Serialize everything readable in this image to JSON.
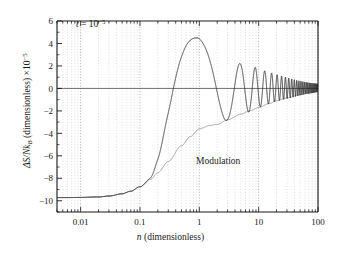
{
  "chart_data": {
    "type": "line",
    "title": "",
    "xlabel": "n (dimensionless)",
    "ylabel": "ΔS/Nk_B (dimensionless) ×10⁻⁵",
    "xscale": "log",
    "yscale": "linear",
    "xlim": [
      0.004,
      100
    ],
    "ylim": [
      -11,
      6
    ],
    "grid": "vertical dotted minor+major log gridlines",
    "legend": "none",
    "annotations": [
      {
        "name": "t-value",
        "text": "t = 10⁻⁵",
        "x": 0.022,
        "y": 5.0
      },
      {
        "name": "modulation-label",
        "text": "Modulation",
        "x": 3.0,
        "y": -6.0
      }
    ],
    "xticks": [
      {
        "value": 0.01,
        "label": "0.01"
      },
      {
        "value": 0.1,
        "label": "0.1"
      },
      {
        "value": 1,
        "label": "1"
      },
      {
        "value": 10,
        "label": "10"
      },
      {
        "value": 100,
        "label": "100"
      }
    ],
    "yticks": [
      {
        "value": 6,
        "label": "6"
      },
      {
        "value": 4,
        "label": "4"
      },
      {
        "value": 2,
        "label": "2"
      },
      {
        "value": 0,
        "label": "0"
      },
      {
        "value": -2,
        "label": "−2"
      },
      {
        "value": -4,
        "label": "−4"
      },
      {
        "value": -6,
        "label": "−6"
      },
      {
        "value": -8,
        "label": "−8"
      },
      {
        "value": -10,
        "label": "−10"
      }
    ],
    "series": [
      {
        "name": "Modulation",
        "style": "thin gray envelope curve",
        "color": "#8a8a8a",
        "description": "Lower envelope rising from plateau -9.7 toward 0",
        "points": [
          {
            "x": 0.004,
            "y": -9.72
          },
          {
            "x": 0.006,
            "y": -9.72
          },
          {
            "x": 0.01,
            "y": -9.7
          },
          {
            "x": 0.02,
            "y": -9.66
          },
          {
            "x": 0.03,
            "y": -9.58
          },
          {
            "x": 0.05,
            "y": -9.38
          },
          {
            "x": 0.07,
            "y": -9.15
          },
          {
            "x": 0.1,
            "y": -8.75
          },
          {
            "x": 0.15,
            "y": -8.1
          },
          {
            "x": 0.2,
            "y": -7.5
          },
          {
            "x": 0.3,
            "y": -6.5
          },
          {
            "x": 0.5,
            "y": -5.1
          },
          {
            "x": 0.7,
            "y": -4.3
          },
          {
            "x": 1.0,
            "y": -3.6
          },
          {
            "x": 1.5,
            "y": -3.3
          },
          {
            "x": 2.0,
            "y": -3.2
          },
          {
            "x": 3.0,
            "y": -2.8
          },
          {
            "x": 5.0,
            "y": -2.3
          },
          {
            "x": 7.0,
            "y": -2.0
          },
          {
            "x": 10,
            "y": -1.7
          },
          {
            "x": 15,
            "y": -1.35
          },
          {
            "x": 20,
            "y": -1.1
          },
          {
            "x": 30,
            "y": -0.85
          },
          {
            "x": 50,
            "y": -0.55
          },
          {
            "x": 70,
            "y": -0.42
          },
          {
            "x": 100,
            "y": -0.3
          }
        ]
      },
      {
        "name": "Entropy change",
        "style": "dark oscillating curve bounded by modulation envelope",
        "color": "#262626",
        "description": "Starts at plateau -9.7, rises, oscillates with decaying amplitude about zero; peak amplitudes 4.5, 2.8, 2.2, 2.0, 1.9 decreasing toward 0.4 at n=100",
        "peaks": [
          {
            "x": 0.95,
            "y": 4.5
          },
          {
            "x": 2.9,
            "y": 2.8
          },
          {
            "x": 4.9,
            "y": 2.2
          },
          {
            "x": 6.6,
            "y": 2.0
          },
          {
            "x": 8.4,
            "y": 1.9
          },
          {
            "x": 12,
            "y": 1.6
          },
          {
            "x": 18,
            "y": 1.3
          },
          {
            "x": 28,
            "y": 1.0
          },
          {
            "x": 45,
            "y": 0.7
          },
          {
            "x": 70,
            "y": 0.5
          },
          {
            "x": 100,
            "y": 0.4
          }
        ],
        "troughs": [
          {
            "x": 1.95,
            "y": -3.25
          },
          {
            "x": 3.9,
            "y": -2.55
          },
          {
            "x": 5.8,
            "y": -2.2
          },
          {
            "x": 7.5,
            "y": -2.05
          },
          {
            "x": 10,
            "y": -1.7
          },
          {
            "x": 15,
            "y": -1.35
          },
          {
            "x": 25,
            "y": -1.0
          },
          {
            "x": 40,
            "y": -0.75
          },
          {
            "x": 60,
            "y": -0.5
          },
          {
            "x": 85,
            "y": -0.38
          },
          {
            "x": 100,
            "y": -0.3
          }
        ],
        "plateau_value": -9.72
      }
    ]
  },
  "axes": {
    "x_label_text": "n (dimensionless)",
    "x_label_italic": "n",
    "x_label_rest": " (dimensionless)",
    "y_label_main": "ΔS/Nk",
    "y_label_sub": "B",
    "y_label_rest": " (dimensionless) ×10",
    "y_label_exp": "−5"
  },
  "annotations": {
    "t_symbol": "t",
    "t_equals": " = 10",
    "t_exponent": "−5",
    "modulation": "Modulation"
  },
  "colors": {
    "axis": "#1a1a1a",
    "gridline": "#bdbdbd",
    "major_gridline": "#9a9a9a",
    "curve_main": "#262626",
    "curve_envelope": "#8f8f8f",
    "background": "#ffffff",
    "text": "#1a1a1a"
  }
}
